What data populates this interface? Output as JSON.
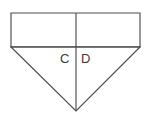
{
  "figure": {
    "type": "geometry-diagram",
    "canvas": {
      "width": 148,
      "height": 120,
      "background": "#ffffff"
    },
    "stroke_color": "#4d4d4d",
    "fill_color": "#ffffff",
    "stroke_width": 1.15,
    "shapes": {
      "rectangle": {
        "name": "top-rectangle",
        "points": "11,13 140,13 140,47 11,47",
        "left": 11,
        "top": 13,
        "right": 140,
        "bottom": 47,
        "width": 129,
        "height": 34
      },
      "triangle": {
        "name": "inverted-triangle",
        "points": "11,47 140,47 76,111",
        "apex": {
          "x": 76,
          "y": 111
        },
        "base_left": {
          "x": 11,
          "y": 47
        },
        "base_right": {
          "x": 140,
          "y": 47
        },
        "base_width": 129,
        "height": 64
      },
      "vertical_line": {
        "name": "vertical-bisector",
        "x": 76,
        "y_start": 13,
        "y_end": 111
      }
    },
    "labels": [
      {
        "id": "C",
        "text": "C",
        "x": 60,
        "y": 52,
        "side": "left-of-bisector"
      },
      {
        "id": "D",
        "text": "D",
        "x": 81,
        "y": 52,
        "side": "right-of-bisector"
      }
    ]
  }
}
